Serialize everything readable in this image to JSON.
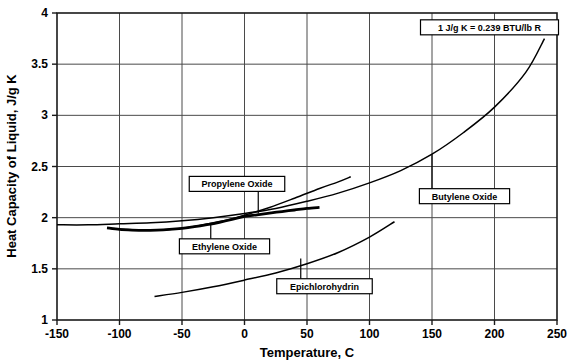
{
  "chart_data": {
    "type": "line",
    "title": "",
    "xlabel": "Temperature, C",
    "ylabel": "Heat Capacity of Liquid, J/g K",
    "xlim": [
      -150,
      250
    ],
    "ylim": [
      1,
      4
    ],
    "xticks": [
      -150,
      -100,
      -50,
      0,
      50,
      100,
      150,
      200,
      250
    ],
    "xtick_labels": [
      "-150",
      "-100",
      "-50",
      "0",
      "50",
      "100",
      "150",
      "200",
      "250"
    ],
    "yticks": [
      1,
      1.5,
      2,
      2.5,
      3,
      3.5,
      4
    ],
    "ytick_labels": [
      "1",
      "1.5",
      "2",
      "2.5",
      "3",
      "3.5",
      "4"
    ],
    "grid": true,
    "legend_position": "inline-callouts",
    "annotations": [
      {
        "name": "unit-conversion-note",
        "text": "1 J/g K = 0.239 BTU/lb R",
        "x": 196,
        "y": 3.86
      }
    ],
    "series": [
      {
        "name": "Butylene Oxide",
        "label_x": 176,
        "label_y": 2.21,
        "leader_to_x": 150,
        "leader_to_y": 2.62,
        "thick": false,
        "x": [
          -150,
          -125,
          -100,
          -75,
          -50,
          -25,
          0,
          25,
          50,
          75,
          100,
          125,
          150,
          175,
          200,
          225,
          240
        ],
        "y": [
          1.93,
          1.93,
          1.94,
          1.95,
          1.97,
          2.0,
          2.04,
          2.09,
          2.16,
          2.24,
          2.34,
          2.46,
          2.62,
          2.83,
          3.08,
          3.42,
          3.75
        ]
      },
      {
        "name": "Propylene Oxide",
        "label_x": -6,
        "label_y": 2.33,
        "leader_to_x": 11,
        "leader_to_y": 2.04,
        "thick": true,
        "x": [
          -110,
          -100,
          -90,
          -80,
          -70,
          -60,
          -50,
          -40,
          -30,
          -20,
          -10,
          0,
          10,
          20,
          30,
          40,
          50,
          60
        ],
        "y": [
          1.9,
          1.885,
          1.878,
          1.875,
          1.878,
          1.885,
          1.896,
          1.912,
          1.932,
          1.955,
          1.982,
          2.012,
          2.028,
          2.045,
          2.06,
          2.075,
          2.09,
          2.1
        ]
      },
      {
        "name": "Ethylene Oxide",
        "label_x": -16,
        "label_y": 1.72,
        "leader_to_x": -27,
        "leader_to_y": 1.945,
        "thick": false,
        "x": [
          -110,
          -95,
          -80,
          -60,
          -40,
          -20,
          0,
          20,
          40,
          60,
          75,
          85
        ],
        "y": [
          1.9,
          1.885,
          1.878,
          1.885,
          1.915,
          1.962,
          2.025,
          2.1,
          2.19,
          2.285,
          2.35,
          2.4
        ]
      },
      {
        "name": "Epichlorohydrin",
        "label_x": 64,
        "label_y": 1.33,
        "leader_to_x": 45,
        "leader_to_y": 1.6,
        "thick": false,
        "x": [
          -72,
          -50,
          -25,
          0,
          25,
          50,
          75,
          100,
          120
        ],
        "y": [
          1.23,
          1.27,
          1.325,
          1.39,
          1.46,
          1.55,
          1.66,
          1.81,
          1.96
        ]
      }
    ]
  }
}
